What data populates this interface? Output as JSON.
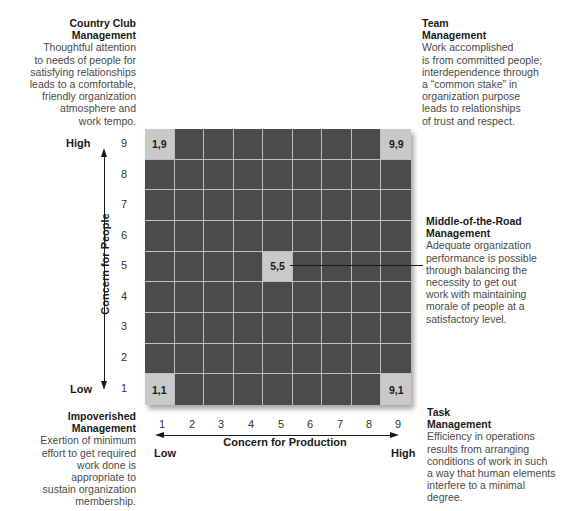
{
  "diagram": {
    "quadrants": {
      "country_club": {
        "title_line1": "Country Club",
        "title_line2": "Management",
        "lines": [
          "Thoughtful attention",
          "to needs of people for",
          "satisfying relationships",
          "leads to a comfortable,",
          "friendly organization",
          "atmosphere and",
          "work tempo."
        ]
      },
      "team": {
        "title_line1": "Team",
        "title_line2": "Management",
        "lines": [
          "Work accomplished",
          "is from committed people;",
          "interdependence through",
          "a “common stake” in",
          "organization purpose",
          "leads to relationships",
          "of trust and respect."
        ]
      },
      "middle": {
        "title_line1": "Middle-of-the-Road",
        "title_line2": "Management",
        "lines": [
          "Adequate organization",
          "performance is possible",
          "through balancing the",
          "necessity to get out",
          "work with maintaining",
          "morale of people at a",
          "satisfactory level."
        ]
      },
      "impoverished": {
        "title_line1": "Impoverished",
        "title_line2": "Management",
        "lines": [
          "Exertion of minimum",
          "effort to get required",
          "work done is",
          "appropriate to",
          "sustain organization",
          "membership."
        ]
      },
      "task": {
        "title_line1": "Task",
        "title_line2": "Management",
        "lines": [
          "Efficiency in operations",
          "results from arranging",
          "conditions of work in such",
          "a way that human elements",
          "interfere to a minimal",
          "degree."
        ]
      }
    },
    "cells": {
      "c19": "1,9",
      "c99": "9,9",
      "c55": "5,5",
      "c11": "1,1",
      "c91": "9,1"
    },
    "y_axis": {
      "label": "Concern for People",
      "high": "High",
      "low": "Low",
      "ticks": [
        "9",
        "8",
        "7",
        "6",
        "5",
        "4",
        "3",
        "2",
        "1"
      ]
    },
    "x_axis": {
      "label": "Concern for Production",
      "high": "High",
      "low": "Low",
      "ticks": [
        "1",
        "2",
        "3",
        "4",
        "5",
        "6",
        "7",
        "8",
        "9"
      ]
    },
    "colors": {
      "grid_fill": "#4b4b4b",
      "highlight_cell": "#c9c9c9",
      "grid_lines": "#bdbdbd"
    }
  }
}
